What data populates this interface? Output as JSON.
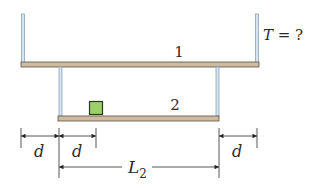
{
  "diagram": {
    "plank1": {
      "label": "1"
    },
    "plank2": {
      "label": "2"
    },
    "tension_label": "T = ?",
    "dimensions": {
      "d_left_outer": "d",
      "d_left_inner": "d",
      "d_right": "d",
      "L2_main": "L",
      "L2_sub": "2"
    },
    "colors": {
      "plank": "#c8b59a",
      "plank_edge": "#6b5d4a",
      "cable": "#a9c4dc",
      "cable_edge": "#7f9db8",
      "box_fill": "#9ccf6a",
      "box_edge": "#2e3a1e",
      "line": "#333333"
    }
  }
}
